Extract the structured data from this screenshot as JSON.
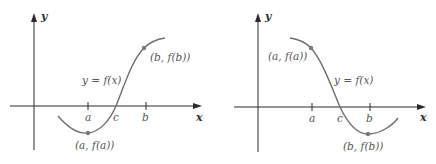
{
  "colors": {
    "axis": "#2a2a2a",
    "curve": "#6e6e6e",
    "point": "#7a7a7a",
    "text": "#555555"
  },
  "panels": [
    {
      "id": "increasing",
      "x_axis_label": "x",
      "y_axis_label": "y",
      "function_label": "y = f(x)",
      "tick_labels": [
        "a",
        "c",
        "b"
      ],
      "point_a_label": "(a, f(a))",
      "point_b_label": "(b, f(b))"
    },
    {
      "id": "decreasing",
      "x_axis_label": "x",
      "y_axis_label": "y",
      "function_label": "y = f(x)",
      "tick_labels": [
        "a",
        "c",
        "b"
      ],
      "point_a_label": "(a, f(a))",
      "point_b_label": "(b, f(b))"
    }
  ]
}
